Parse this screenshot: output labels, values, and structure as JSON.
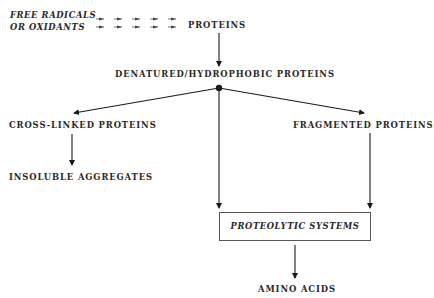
{
  "diagram": {
    "source": {
      "line1": "FREE RADICALS",
      "line2": "OR OXIDANTS"
    },
    "nodes": {
      "proteins": "PROTEINS",
      "denatured": "DENATURED/HYDROPHOBIC PROTEINS",
      "cross_linked": "CROSS-LINKED PROTEINS",
      "insoluble": "INSOLUBLE AGGREGATES",
      "fragmented": "FRAGMENTED PROTEINS",
      "proteolytic": "PROTEOLYTIC SYSTEMS",
      "amino_acids": "AMINO ACIDS"
    },
    "edges": [
      {
        "from": "source",
        "to": "proteins",
        "style": "dashed-arrows"
      },
      {
        "from": "proteins",
        "to": "denatured"
      },
      {
        "from": "denatured",
        "to": "cross_linked"
      },
      {
        "from": "denatured",
        "to": "fragmented"
      },
      {
        "from": "denatured",
        "to": "proteolytic"
      },
      {
        "from": "cross_linked",
        "to": "insoluble"
      },
      {
        "from": "fragmented",
        "to": "proteolytic"
      },
      {
        "from": "proteolytic",
        "to": "amino_acids"
      }
    ]
  }
}
